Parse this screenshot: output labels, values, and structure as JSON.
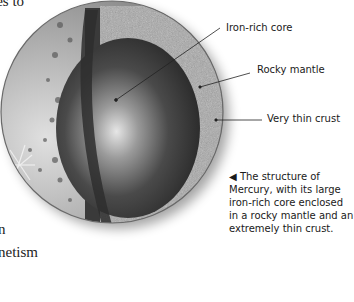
{
  "page": {
    "text_fragments": {
      "top": "ies to",
      "middle": "n",
      "bottom": "netism"
    }
  },
  "figure": {
    "labels": [
      {
        "text": "Iron-rich core"
      },
      {
        "text": "Rocky mantle"
      },
      {
        "text": "Very thin crust"
      }
    ],
    "caption": {
      "marker": "◀",
      "text": " The structure of Mercury, with its large iron-rich core enclosed in a rocky mantle and an extremely thin crust."
    },
    "colors": {
      "core_light": "#d8d8d8",
      "core_dark": "#2a2a2a",
      "mantle": "#a9a9a9",
      "surface": "#9a9a9a"
    }
  }
}
